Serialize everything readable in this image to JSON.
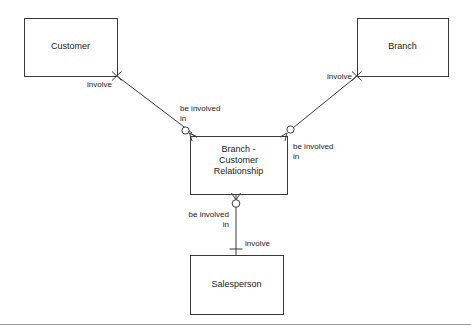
{
  "diagram": {
    "type": "entity-relationship-diagram",
    "notation": "crow's foot",
    "stroke_color": "#3a3a3a",
    "fill_color": "#ffffff",
    "text_color": "#1a1a1a",
    "entities": [
      {
        "id": "customer",
        "label": "Customer",
        "x": 24,
        "y": 18,
        "width": 93,
        "height": 58
      },
      {
        "id": "branch",
        "label": "Branch",
        "x": 357,
        "y": 18,
        "width": 91,
        "height": 58
      },
      {
        "id": "branch-customer-relationship",
        "label": "Branch -\nCustomer\nRelationship",
        "x": 190,
        "y": 136,
        "width": 97,
        "height": 58
      },
      {
        "id": "salesperson",
        "label": "Salesperson",
        "x": 190,
        "y": 255,
        "width": 93,
        "height": 59
      }
    ],
    "connectors": [
      {
        "id": "customer-to-relationship",
        "from": "customer",
        "to": "branch-customer-relationship",
        "from_label": "involve",
        "to_label": "be involved\nin"
      },
      {
        "id": "branch-to-relationship",
        "from": "branch",
        "to": "branch-customer-relationship",
        "from_label": "involve",
        "to_label": "be involved\nin"
      },
      {
        "id": "relationship-to-salesperson",
        "from": "branch-customer-relationship",
        "to": "salesperson",
        "from_label": "be involved\nin",
        "to_label": "involve"
      }
    ],
    "labels": {
      "involve_customer": "involve",
      "involve_branch": "involve",
      "involve_salesperson": "involve",
      "be_involved_in_left": "be involved\nin",
      "be_involved_in_right": "be involved\nin",
      "be_involved_in_bottom": "be involved\nin"
    }
  }
}
